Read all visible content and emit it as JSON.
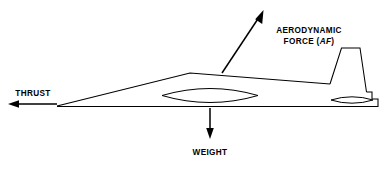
{
  "diagram": {
    "background_color": "#ffffff",
    "line_color": "#000000"
  },
  "labels": {
    "thrust": "THRUST",
    "weight": "WEIGHT",
    "aerodynamic_line1": "AERODYNAMIC",
    "aerodynamic_line2_prefix": "FORCE (",
    "aerodynamic_line2_symbol": "AF",
    "aerodynamic_line2_suffix": ")"
  },
  "vectors": [
    {
      "name": "thrust",
      "label": "THRUST",
      "direction": "left",
      "tail": [
        57,
        104
      ],
      "head": [
        9,
        104
      ]
    },
    {
      "name": "weight",
      "label": "WEIGHT",
      "direction": "down",
      "tail": [
        210,
        108
      ],
      "head": [
        210,
        138
      ]
    },
    {
      "name": "aerodynamic-force",
      "label": "AERODYNAMIC FORCE (AF)",
      "direction": "up-right",
      "tail": [
        222,
        73
      ],
      "head": [
        262,
        12
      ]
    }
  ],
  "aircraft": {
    "nose": [
      57,
      106
    ],
    "apex": [
      190,
      73
    ],
    "fin_base_front": [
      330,
      84
    ],
    "tail_end": [
      378,
      107
    ],
    "belly_line_y": 107,
    "fin": {
      "base_front": [
        330,
        84
      ],
      "top_front": [
        341,
        48
      ],
      "top_rear": [
        360,
        48
      ],
      "base_rear": [
        366,
        92
      ]
    },
    "details": [
      {
        "name": "center-lens",
        "center": [
          210,
          95
        ],
        "width": 96,
        "height": 13
      },
      {
        "name": "aft-lens",
        "center": [
          352,
          100
        ],
        "width": 42,
        "height": 6
      }
    ]
  }
}
